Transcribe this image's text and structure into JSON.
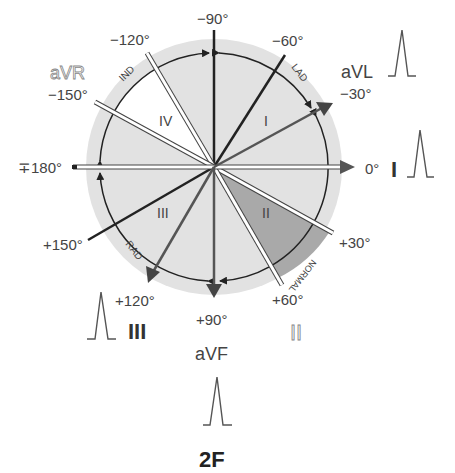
{
  "figure_label": "2F",
  "colors": {
    "disc": "#e2e2e2",
    "normal_sector": "#aaaaaa",
    "ind_sector": "#ffffff",
    "axis_dark": "#222222",
    "axis_gray": "#555555",
    "label_gray": "#555555",
    "avr_label": "#9a9a9a"
  },
  "angles": {
    "m90": "−90°",
    "m60": "−60°",
    "m30": "−30°",
    "m120": "−120°",
    "m150": "−150°",
    "a180": "∓180°",
    "a0": "0°",
    "p30": "+30°",
    "p60": "+60°",
    "p90": "+90°",
    "p120": "+120°",
    "p150": "+150°"
  },
  "leads": {
    "avr": "aVR",
    "avl": "aVL",
    "lead_i": "I",
    "lead_ii": "II",
    "lead_iii": "III",
    "avf": "aVF"
  },
  "quadrants": {
    "q1": "I",
    "q2": "II",
    "q3": "III",
    "q4": "IV"
  },
  "arc_labels": {
    "lad": "LAD",
    "normal": "NORMAL",
    "rad": "RAD",
    "ind": "IND"
  }
}
